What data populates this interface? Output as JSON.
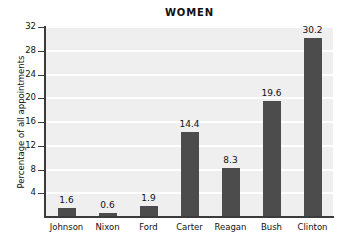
{
  "chart_data": {
    "type": "bar",
    "title": "WOMEN",
    "xlabel": "",
    "ylabel": "Percentage of all appointments",
    "categories": [
      "Johnson",
      "Nixon",
      "Ford",
      "Carter",
      "Reagan",
      "Bush",
      "Clinton"
    ],
    "values": [
      1.6,
      0.6,
      1.9,
      14.4,
      8.3,
      19.6,
      30.2
    ],
    "value_labels": [
      "1.6",
      "0.6",
      "1.9",
      "14.4",
      "8.3",
      "19.6",
      "30.2"
    ],
    "ylim": [
      0,
      32
    ],
    "yticks": [
      4,
      8,
      12,
      16,
      20,
      24,
      28,
      32
    ],
    "ytick_labels": [
      "4",
      "8",
      "12",
      "16",
      "20",
      "24",
      "28",
      "32"
    ],
    "grid": true,
    "legend": "none",
    "colors": {
      "bar": "#4c4c4c",
      "plot_background": "#efefef",
      "gridline": "#ffffff",
      "axis": "#3b3b3b",
      "text": "#111111",
      "page_background": "#ffffff"
    }
  }
}
